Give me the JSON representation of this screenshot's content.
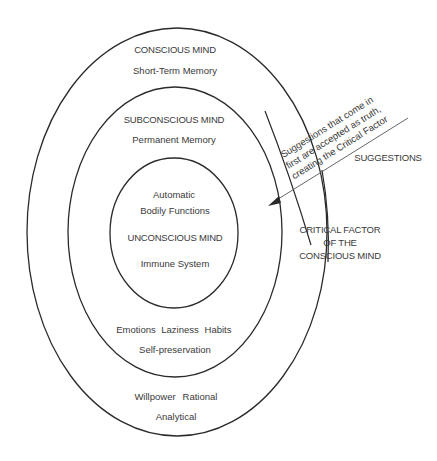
{
  "diagram": {
    "rings": [
      {
        "id": "conscious",
        "title": "CONSCIOUS MIND",
        "subtitle": "Short-Term Memory",
        "bottom_items": [
          "Willpower",
          "Rational"
        ],
        "bottom_item2": "Analytical"
      },
      {
        "id": "subconscious",
        "title": "SUBCONSCIOUS MIND",
        "subtitle": "Permanent Memory",
        "bottom_items": [
          "Emotions",
          "Laziness",
          "Habits"
        ],
        "bottom_item2": "Self-preservation"
      },
      {
        "id": "unconscious",
        "top_line1": "Automatic",
        "top_line2": "Bodily Functions",
        "title": "UNCONSCIOUS MIND",
        "subtitle": "Immune System"
      }
    ],
    "annotations": {
      "suggestions_label": "SUGGESTIONS",
      "diagonal_text": [
        "Suggestions that come in",
        "first are accepted as truth,",
        "creating the Critical Factor"
      ],
      "critical_factor": [
        "CRITICAL FACTOR",
        "OF THE",
        "CONSCIOUS MIND"
      ]
    },
    "colors": {
      "stroke": "#2a2a2a",
      "text": "#3a3a3a",
      "background": "#ffffff"
    }
  }
}
